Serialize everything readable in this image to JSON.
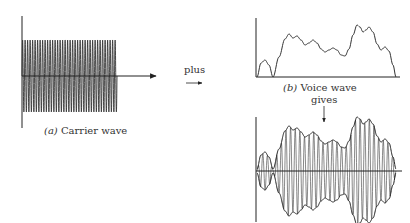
{
  "labels": {
    "carrier_prefix": "(a)",
    "carrier": "Carrier wave",
    "voice_prefix": "(b)",
    "voice": "Voice wave",
    "plus": "plus",
    "gives": "gives"
  },
  "colors": {
    "ink": "#222222",
    "background": "#ffffff"
  },
  "carrier": {
    "x_start": 22,
    "x_end": 117,
    "center_y": 76,
    "amplitude": 36,
    "cycles": 38
  },
  "voice_envelope": [
    [
      0,
      0
    ],
    [
      4,
      14
    ],
    [
      8,
      17
    ],
    [
      12,
      12
    ],
    [
      16,
      0
    ],
    [
      22,
      20
    ],
    [
      28,
      38
    ],
    [
      32,
      43
    ],
    [
      36,
      39
    ],
    [
      40,
      41
    ],
    [
      44,
      37
    ],
    [
      48,
      32
    ],
    [
      52,
      34
    ],
    [
      56,
      37
    ],
    [
      60,
      34
    ],
    [
      64,
      28
    ],
    [
      68,
      25
    ],
    [
      72,
      27
    ],
    [
      76,
      29
    ],
    [
      80,
      27
    ],
    [
      84,
      22
    ],
    [
      88,
      21
    ],
    [
      92,
      28
    ],
    [
      96,
      42
    ],
    [
      100,
      52
    ],
    [
      103,
      50
    ],
    [
      106,
      45
    ],
    [
      109,
      47
    ],
    [
      112,
      50
    ],
    [
      116,
      45
    ],
    [
      120,
      33
    ],
    [
      124,
      27
    ],
    [
      128,
      30
    ],
    [
      132,
      26
    ],
    [
      136,
      12
    ],
    [
      139,
      0
    ]
  ]
}
